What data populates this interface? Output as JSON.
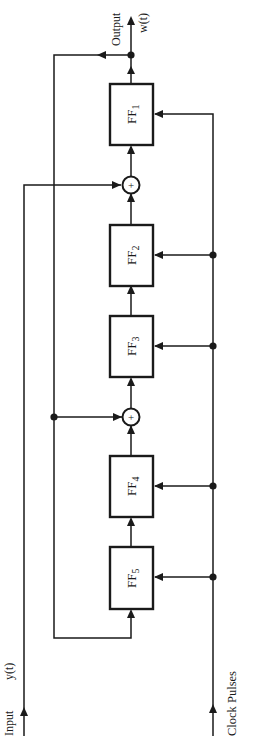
{
  "diagram": {
    "type": "shift-register-circuit",
    "orientation": "rotated-90-ccw",
    "labels": {
      "output_label": "Output",
      "output_signal": "w(t)",
      "input_label": "Input",
      "input_signal": "y(t)",
      "clock_label": "Clock Pulses",
      "sum_symbol": "+"
    },
    "flip_flops": [
      {
        "id": "FF1",
        "base": "FF",
        "sub": "1"
      },
      {
        "id": "FF2",
        "base": "FF",
        "sub": "2"
      },
      {
        "id": "FF3",
        "base": "FF",
        "sub": "3"
      },
      {
        "id": "FF4",
        "base": "FF",
        "sub": "4"
      },
      {
        "id": "FF5",
        "base": "FF",
        "sub": "5"
      }
    ],
    "summing_junctions": [
      {
        "id": "sum_a",
        "between": [
          "FF2",
          "FF1"
        ],
        "side_input": "Input y(t)"
      },
      {
        "id": "sum_b",
        "between": [
          "FF4",
          "FF3"
        ],
        "side_input": "feedback from output w(t)"
      }
    ],
    "connections": [
      "Input y(t) -> sum_a",
      "FF5 -> FF4 -> sum_b -> FF3 -> FF2 -> sum_a -> FF1 -> Output w(t)",
      "Output w(t) -> feedback -> sum_b",
      "Output w(t) -> feedback -> FF5",
      "Clock Pulses -> FF1, FF2, FF3, FF4, FF5"
    ],
    "colors": {
      "ink": "#1a1a1a",
      "background": "#ffffff"
    }
  }
}
